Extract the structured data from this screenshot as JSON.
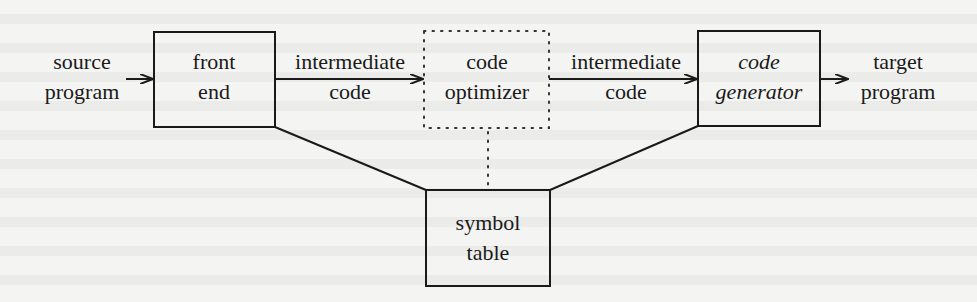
{
  "diagram": {
    "colors": {
      "background": "#f4f4f2",
      "stroke": "#1a1a1a"
    },
    "input": {
      "line1": "source",
      "line2": "program"
    },
    "output": {
      "line1": "target",
      "line2": "program"
    },
    "boxes": [
      {
        "id": "front-end",
        "line1": "front",
        "line2": "end",
        "style": "solid",
        "italic": false
      },
      {
        "id": "code-optimizer",
        "line1": "code",
        "line2": "optimizer",
        "style": "dotted",
        "italic": false
      },
      {
        "id": "code-generator",
        "line1": "code",
        "line2": "generator",
        "style": "solid",
        "italic": true
      },
      {
        "id": "symbol-table",
        "line1": "symbol",
        "line2": "table",
        "style": "solid",
        "italic": false
      }
    ],
    "edges": [
      {
        "from": "source program",
        "to": "front end",
        "label1": "",
        "label2": ""
      },
      {
        "from": "front end",
        "to": "code optimizer",
        "label1": "intermediate",
        "label2": "code"
      },
      {
        "from": "code optimizer",
        "to": "code generator",
        "label1": "intermediate",
        "label2": "code"
      },
      {
        "from": "code generator",
        "to": "target program",
        "label1": "",
        "label2": ""
      },
      {
        "from": "front end",
        "to": "symbol table",
        "type": "line"
      },
      {
        "from": "code optimizer",
        "to": "symbol table",
        "type": "dotted-line"
      },
      {
        "from": "code generator",
        "to": "symbol table",
        "type": "line"
      }
    ]
  }
}
